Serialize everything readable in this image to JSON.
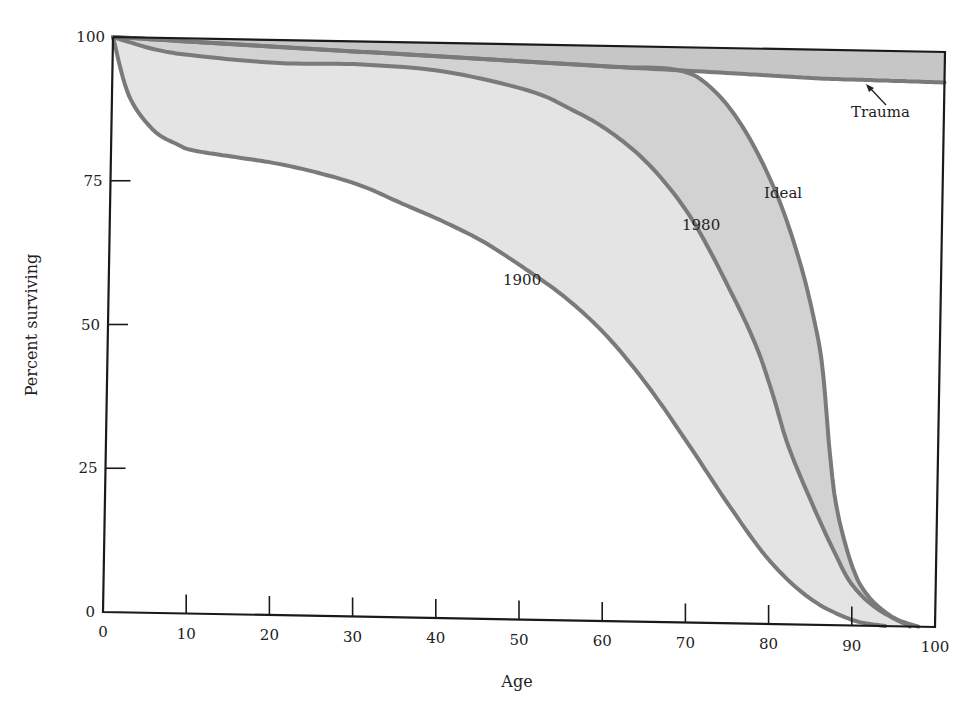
{
  "chart_data": {
    "type": "area",
    "title": "",
    "xlabel": "Age",
    "ylabel": "Percent surviving",
    "xlim": [
      0,
      100
    ],
    "ylim": [
      0,
      100
    ],
    "grid": false,
    "legend_position": "none (inline curve labels)",
    "x_ticks": [
      0,
      10,
      20,
      30,
      40,
      50,
      60,
      70,
      80,
      90,
      100
    ],
    "y_ticks": [
      0,
      25,
      50,
      75,
      100
    ],
    "series": [
      {
        "name": "Trauma",
        "x": [
          0,
          10,
          20,
          30,
          40,
          50,
          60,
          68,
          75,
          80,
          85,
          90,
          95,
          100
        ],
        "values": [
          100,
          99.4,
          98.8,
          98.2,
          97.6,
          97.0,
          96.4,
          96.0,
          95.6,
          95.3,
          95.0,
          94.9,
          94.8,
          94.7
        ]
      },
      {
        "name": "Ideal",
        "x": [
          0,
          10,
          20,
          30,
          40,
          50,
          60,
          68,
          72,
          76,
          80,
          83,
          85,
          86,
          87,
          88,
          90,
          92,
          95,
          98
        ],
        "values": [
          100,
          99.4,
          98.8,
          98.2,
          97.6,
          97.0,
          96.4,
          96.0,
          93,
          86,
          75,
          63,
          52,
          44,
          30,
          20,
          10,
          5,
          1.5,
          0
        ]
      },
      {
        "name": "1980",
        "x": [
          0,
          5,
          10,
          20,
          30,
          40,
          50,
          55,
          60,
          65,
          70,
          75,
          78,
          80,
          82,
          85,
          88,
          90,
          93,
          97
        ],
        "values": [
          100,
          98,
          97,
          96,
          96,
          95,
          92,
          89,
          85,
          79,
          70,
          57,
          48,
          40,
          31,
          21,
          12,
          7,
          3,
          0
        ]
      },
      {
        "name": "1900",
        "x": [
          0,
          2,
          5,
          8,
          10,
          15,
          20,
          25,
          30,
          35,
          40,
          45,
          50,
          55,
          60,
          65,
          70,
          75,
          80,
          85,
          90,
          94
        ],
        "values": [
          100,
          90,
          84,
          81.5,
          80.5,
          79.5,
          78.5,
          77,
          75,
          72,
          69,
          65.5,
          61,
          56,
          49.5,
          41,
          31,
          20.5,
          11,
          4.5,
          1,
          0
        ]
      }
    ],
    "annotations": [
      {
        "text": "Trauma",
        "x": 91,
        "y": 88,
        "arrow_to": [
          87.5,
          95.5
        ]
      },
      {
        "text": "Ideal",
        "x": 80,
        "y": 75
      },
      {
        "text": "1980",
        "x": 72,
        "y": 67
      },
      {
        "text": "1900",
        "x": 50,
        "y": 58
      }
    ],
    "fills": [
      {
        "between": [
          "Trauma",
          "Ideal"
        ],
        "color": "#c9c9c9"
      },
      {
        "between": [
          "Ideal",
          "1980"
        ],
        "color": "#d4d4d4"
      },
      {
        "between": [
          "1980",
          "1900"
        ],
        "color": "#e6e6e6"
      }
    ]
  },
  "labels": {
    "xlabel": "Age",
    "ylabel": "Percent surviving",
    "trauma": "Trauma",
    "ideal": "Ideal",
    "y1980": "1980",
    "y1900": "1900"
  },
  "colors": {
    "curve": "#7a7a7a",
    "axis": "#1a1a1a",
    "band_trauma": "#c6c6c6",
    "band_ideal": "#d2d2d2",
    "band_1980": "#e4e4e4"
  }
}
